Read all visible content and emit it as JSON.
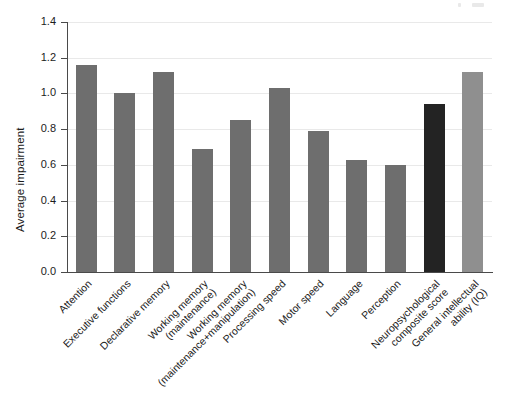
{
  "chart_data": {
    "type": "bar",
    "title": "",
    "xlabel": "",
    "ylabel": "Average impairment",
    "ylim": [
      0.0,
      1.4
    ],
    "ytick_labels": [
      "0.0",
      "0.2",
      "0.4",
      "0.6",
      "0.8",
      "1.0",
      "1.2",
      "1.4"
    ],
    "ytick_values": [
      0.0,
      0.2,
      0.4,
      0.6,
      0.8,
      1.0,
      1.2,
      1.4
    ],
    "grid": true,
    "grid_axis": "y",
    "legend": null,
    "categories": [
      "Attention",
      "Executive functions",
      "Declarative memory",
      "Working memory\n(maintenance)",
      "Working memory\n(maintenance+manipulation)",
      "Processing speed",
      "Motor speed",
      "Language",
      "Perception",
      "Neuropsychological\ncomposite score",
      "General intellectual\nability (IQ)"
    ],
    "values": [
      1.16,
      1.0,
      1.12,
      0.69,
      0.85,
      1.03,
      0.79,
      0.63,
      0.6,
      0.94,
      1.12
    ],
    "bar_colors": [
      "#6e6e6e",
      "#6e6e6e",
      "#6e6e6e",
      "#6e6e6e",
      "#6e6e6e",
      "#6e6e6e",
      "#6e6e6e",
      "#6e6e6e",
      "#6e6e6e",
      "#232323",
      "#8f8f8f"
    ]
  },
  "style": {
    "background": "#ffffff",
    "axis_color": "#4a4a4a",
    "grid_color": "#e9e9e9",
    "text_color": "#1c1c1c",
    "bar_default": "#6e6e6e",
    "bar_highlight": "#232323",
    "bar_light": "#8f8f8f"
  }
}
